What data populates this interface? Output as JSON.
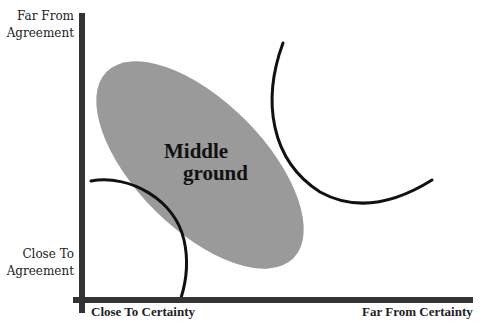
{
  "diagram": {
    "type": "conceptual-quadrant",
    "y_axis": {
      "top_label": [
        "Far From",
        "Agreement"
      ],
      "bottom_label": [
        "Close To",
        "Agreement"
      ]
    },
    "x_axis": {
      "left_label": "Close To Certainty",
      "right_label": "Far From Certainty"
    },
    "regions": [
      {
        "name": "middle-ground",
        "label_lines": [
          "Middle",
          "ground"
        ],
        "shape": "rotated-ellipse",
        "fill": "#9a9a9a"
      }
    ],
    "boundary_curves": [
      {
        "name": "lower-left-boundary",
        "description": "arc near Close To Certainty / Close To Agreement corner"
      },
      {
        "name": "upper-right-boundary",
        "description": "arc toward Far From Certainty / Far From Agreement"
      }
    ]
  },
  "colors": {
    "axis": "#333333",
    "ellipse": "#9a9a9a",
    "curve": "#111111",
    "text": "#222222",
    "background": "#ffffff"
  }
}
